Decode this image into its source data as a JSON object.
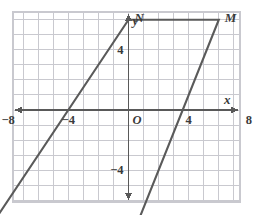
{
  "figure": {
    "type": "coordinate-plane-geometry",
    "background_color": "#ffffff",
    "grid_color": "#c9c9cf",
    "axis_color": "#595959",
    "shape_color": "#5a5a5a"
  },
  "axes": {
    "x_label": "x",
    "y_label": "y",
    "origin_label": "O",
    "x_ticks": [
      "−12",
      "−8",
      "−4",
      "4",
      "8",
      "12"
    ],
    "x_tick_values": [
      -12,
      -8,
      -4,
      4,
      8,
      12
    ],
    "y_ticks": [
      "8",
      "4",
      "−4",
      "8"
    ],
    "y_tick_values": [
      8,
      4,
      -4,
      -8
    ],
    "x_range": [
      -14,
      14
    ],
    "y_range": [
      -11,
      9
    ],
    "grid_step": 1,
    "tick_step": 4
  },
  "chart_data": {
    "type": "scatter",
    "title": "",
    "xlabel": "x",
    "ylabel": "y",
    "xlim": [
      -14,
      14
    ],
    "ylim": [
      -11,
      9
    ],
    "grid": true,
    "legend": "none",
    "points": [
      {
        "label": "N",
        "x": 0,
        "y": 6,
        "label_dx": 6,
        "label_dy": -2
      },
      {
        "label": "M",
        "x": 6,
        "y": 6,
        "label_dx": 6,
        "label_dy": -2
      },
      {
        "label": "Q",
        "x": 0,
        "y": -9,
        "label_dx": 6,
        "label_dy": 12
      },
      {
        "label": "P",
        "x": -10,
        "y": -9,
        "label_dx": -12,
        "label_dy": 12
      }
    ],
    "polygon": {
      "name": "MNPQ",
      "closed": true,
      "vertices": [
        {
          "label": "N",
          "x": 0,
          "y": 6
        },
        {
          "label": "M",
          "x": 6,
          "y": 6
        },
        {
          "label": "Q",
          "x": 0,
          "y": -9
        },
        {
          "label": "P",
          "x": -10,
          "y": -9
        }
      ]
    }
  },
  "labels": {
    "N": "N",
    "M": "M",
    "P": "P",
    "Q": "Q"
  }
}
